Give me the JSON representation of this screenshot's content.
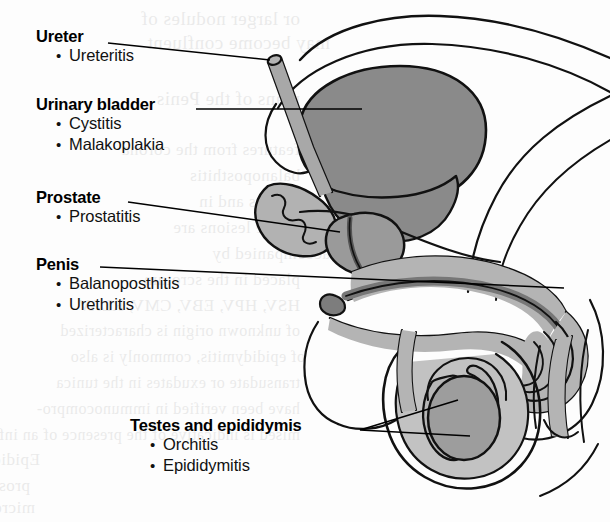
{
  "figure": {
    "background_color": "#fdfdfd",
    "line_color": "#111111",
    "fill_dark": "#8a8a8a",
    "fill_mid": "#9e9e9e",
    "fill_light": "#b8b8b8",
    "fill_white": "#ffffff"
  },
  "labels": [
    {
      "id": "ureter",
      "header": "Ureter",
      "items": [
        "Ureteritis"
      ]
    },
    {
      "id": "urinary-bladder",
      "header": "Urinary bladder",
      "items": [
        "Cystitis",
        "Malakoplakia"
      ]
    },
    {
      "id": "prostate",
      "header": "Prostate",
      "items": [
        "Prostatitis"
      ]
    },
    {
      "id": "penis",
      "header": "Penis",
      "items": [
        "Balanoposthitis",
        "Urethritis"
      ]
    },
    {
      "id": "testes-epididymis",
      "header": "Testes and epididymis",
      "items": [
        "Orchitis",
        "Epididymitis"
      ]
    }
  ],
  "bullet_glyph": "•",
  "ghost_text": [
    {
      "text": "or larger nodules of",
      "x": 300,
      "y": 8,
      "size": 19
    },
    {
      "text": "may become confluent",
      "x": 330,
      "y": 32,
      "size": 19
    },
    {
      "text": "plans of the Penis",
      "x": 300,
      "y": 88,
      "size": 19
    },
    {
      "text": "features from the corona",
      "x": 300,
      "y": 140,
      "size": 17
    },
    {
      "text": "balanoposthitis",
      "x": 300,
      "y": 166,
      "size": 17
    },
    {
      "text": "the dartos and in",
      "x": 320,
      "y": 192,
      "size": 17
    },
    {
      "text": "that the lesions are",
      "x": 310,
      "y": 218,
      "size": 17
    },
    {
      "text": "accompanied by",
      "x": 330,
      "y": 244,
      "size": 17
    },
    {
      "text": "placed in the scrotum",
      "x": 300,
      "y": 270,
      "size": 17
    },
    {
      "text": "HSV, HPV, EBV, CMV, RLAV",
      "x": 300,
      "y": 296,
      "size": 17
    },
    {
      "text": "of unknown origin is characterized",
      "x": 300,
      "y": 322,
      "size": 16
    },
    {
      "text": "of epididymitis, commonly is also",
      "x": 305,
      "y": 348,
      "size": 16
    },
    {
      "text": "transudate or exudates in the tunica",
      "x": 300,
      "y": 374,
      "size": 16
    },
    {
      "text": "have been verified in immunocompro-",
      "x": 300,
      "y": 400,
      "size": 16
    },
    {
      "text": "mised is indicative of the presence of an infection",
      "x": 300,
      "y": 426,
      "size": 16
    },
    {
      "text": "Epididymitis",
      "x": 40,
      "y": 450,
      "size": 17
    },
    {
      "text": "prostatitis",
      "x": 30,
      "y": 476,
      "size": 17
    },
    {
      "text": "microorganisms",
      "x": 35,
      "y": 498,
      "size": 17
    }
  ]
}
